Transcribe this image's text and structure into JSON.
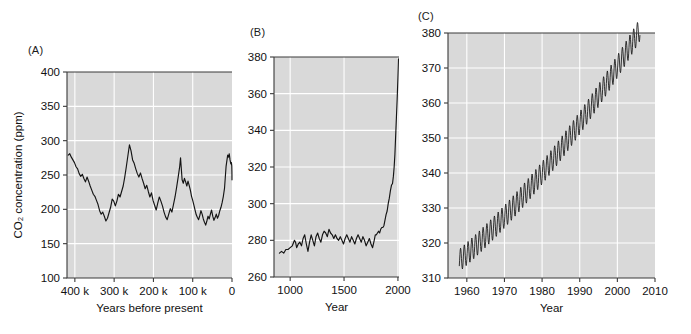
{
  "figure": {
    "panels": [
      {
        "label": "(A)",
        "chart_data": {
          "type": "line",
          "title": "",
          "xlabel": "Years before present",
          "ylabel": "CO2 concentration (ppm)",
          "ylabel_display": "CO₂ concentration (ppm)",
          "xlim": [
            420000,
            0
          ],
          "ylim": [
            100,
            400
          ],
          "yticks": [
            100,
            150,
            200,
            250,
            300,
            350,
            400
          ],
          "ytick_labels": [
            "100",
            "150",
            "200",
            "250",
            "300",
            "350",
            "400"
          ],
          "xticks": [
            400000,
            300000,
            200000,
            100000,
            0
          ],
          "xtick_labels": [
            "400 k",
            "300 k",
            "200 k",
            "100 k",
            "0"
          ],
          "grid": true,
          "x_inverted": true,
          "x": [
            417000,
            413000,
            409000,
            405000,
            401000,
            397000,
            393000,
            389000,
            385000,
            381000,
            377000,
            373000,
            369000,
            365000,
            361000,
            357000,
            353000,
            349000,
            345000,
            341000,
            337000,
            333000,
            329000,
            325000,
            321000,
            317000,
            313000,
            309000,
            305000,
            301000,
            297000,
            293000,
            289000,
            285000,
            281000,
            277000,
            273000,
            269000,
            265000,
            261000,
            257000,
            253000,
            249000,
            245000,
            241000,
            237000,
            233000,
            229000,
            225000,
            221000,
            217000,
            213000,
            209000,
            205000,
            201000,
            197000,
            193000,
            189000,
            185000,
            181000,
            177000,
            173000,
            169000,
            165000,
            161000,
            157000,
            153000,
            149000,
            145000,
            141000,
            137000,
            133000,
            131000,
            129000,
            127000,
            124000,
            121000,
            118000,
            115000,
            112000,
            109000,
            106000,
            103000,
            100000,
            97000,
            94000,
            91000,
            88000,
            85000,
            82000,
            79000,
            76000,
            73000,
            70000,
            67000,
            64000,
            61000,
            58000,
            55000,
            52000,
            49000,
            46000,
            43000,
            40000,
            37000,
            34000,
            31000,
            28000,
            25000,
            22000,
            19000,
            17000,
            15000,
            13000,
            11000,
            9000,
            7000,
            5000,
            3000,
            1500,
            500,
            200,
            100,
            50
          ],
          "y": [
            279,
            281,
            276,
            272,
            268,
            262,
            259,
            252,
            248,
            251,
            245,
            240,
            247,
            241,
            234,
            228,
            222,
            219,
            213,
            207,
            198,
            193,
            196,
            190,
            183,
            187,
            195,
            203,
            215,
            212,
            205,
            212,
            222,
            218,
            226,
            234,
            247,
            262,
            278,
            294,
            285,
            272,
            267,
            259,
            252,
            247,
            253,
            245,
            238,
            230,
            235,
            226,
            218,
            224,
            213,
            206,
            199,
            209,
            218,
            212,
            205,
            196,
            189,
            185,
            193,
            201,
            196,
            207,
            218,
            232,
            247,
            263,
            275,
            259,
            243,
            238,
            245,
            240,
            234,
            241,
            235,
            228,
            219,
            213,
            206,
            199,
            192,
            188,
            185,
            191,
            198,
            193,
            186,
            181,
            177,
            183,
            190,
            186,
            193,
            199,
            190,
            184,
            188,
            193,
            187,
            191,
            198,
            203,
            210,
            219,
            231,
            247,
            263,
            271,
            279,
            276,
            281,
            272,
            266,
            268,
            263,
            255,
            249,
            243,
            238,
            231,
            226,
            220,
            215,
            222,
            228,
            235,
            230,
            224,
            218,
            212,
            207,
            214,
            221,
            216,
            209,
            203,
            197,
            192,
            199,
            206,
            212,
            204,
            198,
            193,
            188,
            194,
            201,
            196,
            190,
            185,
            181,
            178,
            184,
            190,
            186,
            193,
            189,
            184,
            180,
            186,
            192,
            198,
            205,
            213,
            222,
            234,
            246,
            258,
            265,
            272,
            278,
            283,
            294,
            320,
            348,
            365
          ]
        }
      },
      {
        "label": "(B)",
        "chart_data": {
          "type": "line",
          "title": "",
          "xlabel": "Year",
          "ylabel": "",
          "xlim": [
            850,
            2010
          ],
          "ylim": [
            260,
            380
          ],
          "yticks": [
            260,
            280,
            300,
            320,
            340,
            360,
            380
          ],
          "ytick_labels": [
            "260",
            "280",
            "300",
            "320",
            "340",
            "360",
            "380"
          ],
          "xticks": [
            1000,
            1500,
            2000
          ],
          "xtick_labels": [
            "1000",
            "1500",
            "2000"
          ],
          "grid": true,
          "x": [
            900,
            920,
            940,
            960,
            980,
            1000,
            1020,
            1040,
            1050,
            1060,
            1075,
            1090,
            1105,
            1120,
            1135,
            1150,
            1165,
            1180,
            1195,
            1210,
            1225,
            1240,
            1255,
            1270,
            1285,
            1300,
            1315,
            1330,
            1345,
            1360,
            1375,
            1390,
            1405,
            1420,
            1435,
            1450,
            1465,
            1480,
            1495,
            1510,
            1525,
            1540,
            1555,
            1570,
            1585,
            1600,
            1615,
            1630,
            1645,
            1660,
            1675,
            1690,
            1705,
            1720,
            1735,
            1750,
            1765,
            1780,
            1790,
            1800,
            1810,
            1820,
            1830,
            1840,
            1850,
            1860,
            1870,
            1880,
            1890,
            1900,
            1910,
            1920,
            1930,
            1940,
            1950,
            1958,
            1965,
            1972,
            1979,
            1986,
            1993,
            2000,
            2005
          ],
          "y": [
            273,
            274,
            273,
            275,
            275,
            276,
            277,
            280,
            279,
            276,
            278,
            279,
            277,
            281,
            283,
            278,
            274,
            279,
            283,
            280,
            277,
            282,
            284,
            281,
            279,
            283,
            285,
            284,
            282,
            286,
            284,
            283,
            281,
            283,
            281,
            280,
            282,
            280,
            278,
            281,
            283,
            281,
            279,
            282,
            280,
            278,
            281,
            283,
            281,
            279,
            282,
            280,
            277,
            279,
            281,
            278,
            276,
            280,
            283,
            283,
            284,
            285,
            284,
            286,
            287,
            287,
            288,
            291,
            294,
            296,
            300,
            303,
            307,
            310,
            311,
            315,
            320,
            327,
            337,
            347,
            357,
            369,
            379
          ]
        }
      },
      {
        "label": "(C)",
        "chart_data": {
          "type": "line",
          "title": "",
          "xlabel": "Year",
          "ylabel": "",
          "xlim": [
            1955,
            2010
          ],
          "ylim": [
            310,
            380
          ],
          "yticks": [
            310,
            320,
            330,
            340,
            350,
            360,
            370,
            380
          ],
          "ytick_labels": [
            "310",
            "320",
            "330",
            "340",
            "350",
            "360",
            "370",
            "380"
          ],
          "xticks": [
            1960,
            1970,
            1980,
            1990,
            2000,
            2010
          ],
          "xtick_labels": [
            "1960",
            "1970",
            "1980",
            "1990",
            "2000",
            "2010"
          ],
          "grid": true,
          "series_description": "Mauna Loa monthly mean CO2 with seasonal cycle",
          "trend_start_year": 1958,
          "trend_end_year": 2006,
          "trend_start_value": 315.0,
          "trend_end_value": 381.0,
          "seasonal_amplitude_ppm": 3.2,
          "seasonal_peak_month": 5,
          "samples_per_year": 12
        }
      }
    ]
  }
}
